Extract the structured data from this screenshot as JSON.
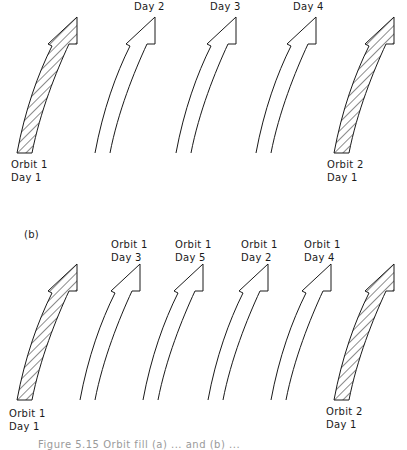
{
  "panel_a": {
    "top_labels": [
      {
        "text": "Day 2",
        "x": 134,
        "y": 0
      },
      {
        "text": "Day 3",
        "x": 210,
        "y": 0
      },
      {
        "text": "Day 4",
        "x": 293,
        "y": 0
      }
    ],
    "bottom_labels": [
      {
        "line1": "Orbit 1",
        "line2": "Day 1",
        "x": 11,
        "y": 158
      },
      {
        "line1": "Orbit 2",
        "line2": "Day 1",
        "x": 327,
        "y": 158
      }
    ],
    "arrows": [
      {
        "style": "hatched",
        "tip_x": 77,
        "dx": 0
      },
      {
        "style": "open",
        "tip_x": 155,
        "dx": 78
      },
      {
        "style": "open",
        "tip_x": 236,
        "dx": 159
      },
      {
        "style": "open",
        "tip_x": 316,
        "dx": 239
      },
      {
        "style": "hatched",
        "tip_x": 394,
        "dx": 317
      }
    ]
  },
  "panel_b": {
    "panel_label": "(b)",
    "top_labels": [
      {
        "line1": "Orbit 1",
        "line2": "Day 3",
        "x": 111,
        "y": 240
      },
      {
        "line1": "Orbit 1",
        "line2": "Day 5",
        "x": 175,
        "y": 240
      },
      {
        "line1": "Orbit 1",
        "line2": "Day 2",
        "x": 241,
        "y": 240
      },
      {
        "line1": "Orbit 1",
        "line2": "Day 4",
        "x": 304,
        "y": 240
      }
    ],
    "bottom_labels": [
      {
        "line1": "Orbit 1",
        "line2": "Day 1",
        "x": 9,
        "y": 407
      },
      {
        "line1": "Orbit 2",
        "line2": "Day 1",
        "x": 326,
        "y": 407
      }
    ],
    "arrows": [
      {
        "style": "hatched",
        "dx": 0
      },
      {
        "style": "open",
        "dx": 63
      },
      {
        "style": "open",
        "dx": 126
      },
      {
        "style": "open",
        "dx": 191
      },
      {
        "style": "open",
        "dx": 254
      },
      {
        "style": "hatched",
        "dx": 317
      }
    ]
  },
  "caption": "Figure 5.15   Orbit fill (a) ... and (b) ..."
}
